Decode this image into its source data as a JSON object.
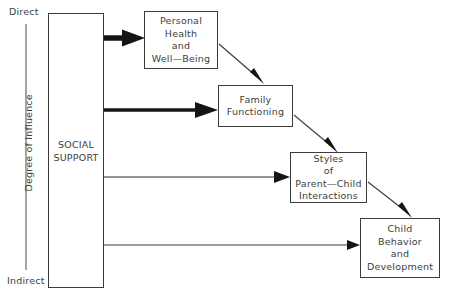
{
  "diagram": {
    "type": "flow-diagram",
    "background_color": "#ffffff",
    "stroke_color": "#3b3b3b",
    "text_color": "#3d3d3d",
    "axis": {
      "name": "Degree of Influence",
      "top_label": "Direct",
      "bottom_label": "Indirect",
      "orientation": "vertical"
    },
    "nodes": {
      "social_support": {
        "lines": [
          "SOCIAL",
          "SUPPORT"
        ],
        "line1": "SOCIAL",
        "line2": "SUPPORT"
      },
      "personal_health": {
        "lines": [
          "Personal",
          "Health",
          "and",
          "Well—Being"
        ],
        "line1": "Personal",
        "line2": "Health",
        "line3": "and",
        "line4": "Well—Being"
      },
      "family_functioning": {
        "lines": [
          "Family",
          "Functioning"
        ],
        "line1": "Family",
        "line2": "Functioning"
      },
      "parent_child_styles": {
        "lines": [
          "Styles",
          "of",
          "Parent—Child",
          "Interactions"
        ],
        "line1": "Styles",
        "line2": "of",
        "line3": "Parent—Child",
        "line4": "Interactions"
      },
      "child_behavior": {
        "lines": [
          "Child",
          "Behavior",
          "and",
          "Development"
        ],
        "line1": "Child",
        "line2": "Behavior",
        "line3": "and",
        "line4": "Development"
      }
    },
    "edges": [
      {
        "name": "social-support-to-personal-health",
        "from": "social_support",
        "to": "personal_health",
        "style": "thick-horizontal",
        "weight": "strong"
      },
      {
        "name": "social-support-to-family-functioning",
        "from": "social_support",
        "to": "family_functioning",
        "style": "thick-horizontal",
        "weight": "strong"
      },
      {
        "name": "social-support-to-parent-child-styles",
        "from": "social_support",
        "to": "parent_child_styles",
        "style": "thin-horizontal",
        "weight": "moderate"
      },
      {
        "name": "social-support-to-child-behavior",
        "from": "social_support",
        "to": "child_behavior",
        "style": "thin-horizontal",
        "weight": "weak"
      },
      {
        "name": "personal-health-to-family-functioning",
        "from": "personal_health",
        "to": "family_functioning",
        "style": "thin-diagonal",
        "weight": "moderate"
      },
      {
        "name": "family-functioning-to-parent-child-styles",
        "from": "family_functioning",
        "to": "parent_child_styles",
        "style": "thin-diagonal",
        "weight": "moderate"
      },
      {
        "name": "parent-child-styles-to-child-behavior",
        "from": "parent_child_styles",
        "to": "child_behavior",
        "style": "thin-diagonal",
        "weight": "moderate"
      }
    ]
  }
}
